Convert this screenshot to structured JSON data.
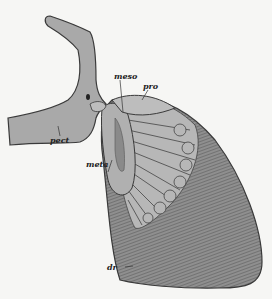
{
  "figure": {
    "labels": {
      "meso": "meso",
      "pro": "pro",
      "pect": "pect",
      "meta": "meta",
      "dr": "dr"
    },
    "colors": {
      "background": "#f6f6f4",
      "bone": "#a9a9a9",
      "bone_dark": "#8d8d8d",
      "cartilage": "#b9b9b9",
      "rays": "#7c7c7c",
      "outline": "#3a3a3a"
    }
  }
}
